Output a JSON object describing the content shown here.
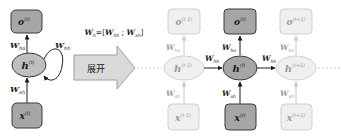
{
  "colors": {
    "active_fill": "#a6a6a6",
    "active_stroke": "#3a3a3a",
    "hidden_active_fill": "#bfbfbf",
    "faded_fill": "#efefef",
    "faded_stroke": "#cfcfcf",
    "arrow_fill": "#d9d9d9",
    "arrow_stroke": "#a0a0a0",
    "text_dark": "#1a1a1a",
    "text_faded": "#9a9a9a"
  },
  "folded": {
    "output_node": {
      "symbol": "o",
      "superscript": "(t)"
    },
    "hidden_node": {
      "symbol": "h",
      "superscript": "(t)"
    },
    "input_node": {
      "symbol": "x",
      "superscript": "(t)"
    },
    "w_ho": {
      "symbol": "W",
      "subscript": "ho"
    },
    "w_hh": {
      "symbol": "W",
      "subscript": "hh"
    },
    "w_xh": {
      "symbol": "W",
      "subscript": "xh"
    }
  },
  "formula": {
    "lhs_symbol": "W",
    "lhs_subscript": "h",
    "equals": "=[",
    "term1_symbol": "W",
    "term1_subscript": "hh",
    "separator": " ; ",
    "term2_symbol": "W",
    "term2_subscript": "xh",
    "close": "]"
  },
  "unroll_arrow": {
    "label": "展开"
  },
  "unrolled": [
    {
      "step": "t-1",
      "state": "faded",
      "output": {
        "symbol": "o",
        "superscript": "(t-1)"
      },
      "hidden": {
        "symbol": "h",
        "superscript": "(t-1)"
      },
      "input": {
        "symbol": "x",
        "superscript": "(t-1)"
      },
      "w_ho": {
        "symbol": "W",
        "subscript": "ho"
      },
      "w_xh": {
        "symbol": "W",
        "subscript": "xh"
      }
    },
    {
      "step": "t",
      "state": "active",
      "output": {
        "symbol": "o",
        "superscript": "(t)"
      },
      "hidden": {
        "symbol": "h",
        "superscript": "(t)"
      },
      "input": {
        "symbol": "x",
        "superscript": "(t)"
      },
      "w_ho": {
        "symbol": "W",
        "subscript": "ho"
      },
      "w_xh": {
        "symbol": "W",
        "subscript": "xh"
      },
      "w_hh_in": {
        "symbol": "W",
        "subscript": "hh"
      }
    },
    {
      "step": "t+1",
      "state": "faded",
      "output": {
        "symbol": "o",
        "superscript": "(t+1)"
      },
      "hidden": {
        "symbol": "h",
        "superscript": "(t+1)"
      },
      "input": {
        "symbol": "x",
        "superscript": "(t+1)"
      },
      "w_ho": {
        "symbol": "W",
        "subscript": "ho"
      },
      "w_xh": {
        "symbol": "W",
        "subscript": "xh"
      },
      "w_hh_in": {
        "symbol": "W",
        "subscript": "hh"
      }
    }
  ]
}
